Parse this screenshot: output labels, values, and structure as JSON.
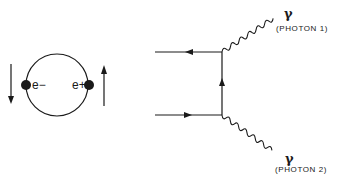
{
  "diagram": {
    "left_panel": {
      "description": "Positronium: electron and positron orbiting",
      "electron_label": "e−",
      "positron_label": "e+",
      "electron_spin": "down",
      "positron_spin": "up"
    },
    "feynman_diagram": {
      "photons": [
        {
          "symbol": "γ",
          "label": "(PHOTON 1)"
        },
        {
          "symbol": "γ",
          "label": "(PHOTON 2)"
        }
      ],
      "fermion_lines": [
        {
          "name": "top-incoming",
          "arrow": "left"
        },
        {
          "name": "internal-propagator",
          "arrow": "up"
        },
        {
          "name": "bottom-incoming",
          "arrow": "right"
        }
      ]
    },
    "colors": {
      "ink": "#1a1a1a",
      "background": "#ffffff"
    }
  }
}
